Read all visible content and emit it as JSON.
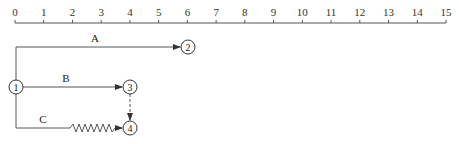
{
  "timescale": {
    "ticks": [
      "0",
      "1",
      "2",
      "3",
      "4",
      "5",
      "6",
      "7",
      "8",
      "9",
      "10",
      "11",
      "12",
      "13",
      "14",
      "15"
    ]
  },
  "nodes": [
    {
      "id": "1",
      "label": "1"
    },
    {
      "id": "2",
      "label": "2"
    },
    {
      "id": "3",
      "label": "3"
    },
    {
      "id": "4",
      "label": "4"
    }
  ],
  "activities": [
    {
      "label": "A",
      "from": "1",
      "to": "2",
      "style": "solid"
    },
    {
      "label": "B",
      "from": "1",
      "to": "3",
      "style": "solid"
    },
    {
      "label": "C",
      "from": "1",
      "to": "4",
      "style": "solid+wavy (free float)"
    },
    {
      "label": "",
      "from": "3",
      "to": "4",
      "style": "dashed (dummy)"
    }
  ],
  "colors": {
    "line": "#555555",
    "text": "#222222",
    "background": "#ffffff"
  }
}
